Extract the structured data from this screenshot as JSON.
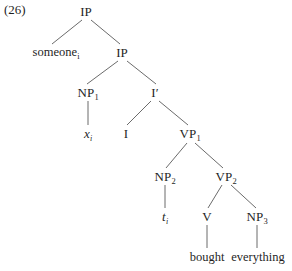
{
  "figure": {
    "example_number": "(26)",
    "kind": "syntax-tree",
    "sentence": "someone bought everything",
    "line_color": "#6b6b6b",
    "text_color": "#1f1f1f",
    "background_color": "#ffffff"
  },
  "tree": {
    "nodes": [
      {
        "id": "ip-root",
        "label": "IP",
        "sub": "",
        "italic": false,
        "x": 86,
        "y": 11
      },
      {
        "id": "someone",
        "label": "someone",
        "sub": "i",
        "italic": false,
        "x": 56,
        "y": 52
      },
      {
        "id": "ip-lower",
        "label": "IP",
        "sub": "",
        "italic": false,
        "x": 122,
        "y": 52
      },
      {
        "id": "np1",
        "label": "NP",
        "sub": "1",
        "italic": false,
        "x": 88,
        "y": 92
      },
      {
        "id": "ibar",
        "label": "I′",
        "sub": "",
        "italic": false,
        "x": 155,
        "y": 92
      },
      {
        "id": "x-var",
        "label": "x",
        "sub": "i",
        "italic": true,
        "x": 88,
        "y": 133
      },
      {
        "id": "i-head",
        "label": "I",
        "sub": "",
        "italic": false,
        "x": 126,
        "y": 133
      },
      {
        "id": "vp1",
        "label": "VP",
        "sub": "1",
        "italic": false,
        "x": 190,
        "y": 133
      },
      {
        "id": "np2",
        "label": "NP",
        "sub": "2",
        "italic": false,
        "x": 165,
        "y": 176
      },
      {
        "id": "vp2",
        "label": "VP",
        "sub": "2",
        "italic": false,
        "x": 226,
        "y": 176
      },
      {
        "id": "trace",
        "label": "t",
        "sub": "i",
        "italic": true,
        "x": 165,
        "y": 216
      },
      {
        "id": "v-head",
        "label": "V",
        "sub": "",
        "italic": false,
        "x": 207,
        "y": 216
      },
      {
        "id": "np3",
        "label": "NP",
        "sub": "3",
        "italic": false,
        "x": 257,
        "y": 216
      },
      {
        "id": "bought",
        "label": "bought",
        "sub": "",
        "italic": false,
        "x": 207,
        "y": 257
      },
      {
        "id": "everything",
        "label": "everything",
        "sub": "",
        "italic": false,
        "x": 258,
        "y": 257
      }
    ],
    "edges": [
      {
        "from": "ip-root",
        "to": "someone",
        "x1": 82,
        "y1": 20,
        "x2": 52,
        "y2": 44
      },
      {
        "from": "ip-root",
        "to": "ip-lower",
        "x1": 91,
        "y1": 20,
        "x2": 120,
        "y2": 44
      },
      {
        "from": "ip-lower",
        "to": "np1",
        "x1": 118,
        "y1": 61,
        "x2": 87,
        "y2": 84
      },
      {
        "from": "ip-lower",
        "to": "ibar",
        "x1": 127,
        "y1": 61,
        "x2": 156,
        "y2": 84
      },
      {
        "from": "np1",
        "to": "x-var",
        "x1": 88,
        "y1": 101,
        "x2": 88,
        "y2": 125
      },
      {
        "from": "ibar",
        "to": "i-head",
        "x1": 151,
        "y1": 101,
        "x2": 127,
        "y2": 125
      },
      {
        "from": "ibar",
        "to": "vp1",
        "x1": 159,
        "y1": 101,
        "x2": 188,
        "y2": 125
      },
      {
        "from": "vp1",
        "to": "np2",
        "x1": 187,
        "y1": 143,
        "x2": 166,
        "y2": 168
      },
      {
        "from": "vp1",
        "to": "vp2",
        "x1": 195,
        "y1": 143,
        "x2": 223,
        "y2": 168
      },
      {
        "from": "np2",
        "to": "trace",
        "x1": 165,
        "y1": 185,
        "x2": 165,
        "y2": 208
      },
      {
        "from": "vp2",
        "to": "v-head",
        "x1": 222,
        "y1": 185,
        "x2": 208,
        "y2": 208
      },
      {
        "from": "vp2",
        "to": "np3",
        "x1": 231,
        "y1": 185,
        "x2": 256,
        "y2": 208
      },
      {
        "from": "v-head",
        "to": "bought",
        "x1": 207,
        "y1": 225,
        "x2": 207,
        "y2": 248
      },
      {
        "from": "np3",
        "to": "everything",
        "x1": 257,
        "y1": 225,
        "x2": 257,
        "y2": 248
      }
    ]
  }
}
